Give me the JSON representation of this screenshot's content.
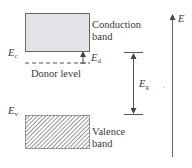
{
  "diagram": {
    "title": "",
    "conduction_band": {
      "label_line1": "Conduction",
      "label_line2": "band",
      "fill": "#e2e3e6",
      "edge_symbol": "E",
      "edge_sub": "c"
    },
    "donor_level": {
      "label": "Donor level",
      "symbol": "E",
      "sub": "d"
    },
    "valence_band": {
      "label_line1": "Valence",
      "label_line2": "band",
      "edge_symbol": "E",
      "edge_sub": "v"
    },
    "band_gap": {
      "symbol": "E",
      "sub": "g"
    },
    "energy_axis": {
      "symbol": "E"
    },
    "colors": {
      "line": "#555555",
      "band_fill": "#e2e3e6",
      "hatch": "#666666"
    }
  }
}
